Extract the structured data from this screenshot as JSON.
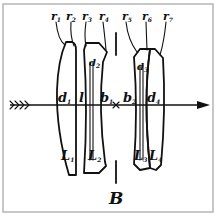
{
  "figure": {
    "frame_color": "#b5b5b5",
    "ink_color": "#111111",
    "background": "#ffffff"
  },
  "radii_labels": [
    {
      "id": "r1",
      "base": "r",
      "sub": "1"
    },
    {
      "id": "r2",
      "base": "r",
      "sub": "2"
    },
    {
      "id": "r3",
      "base": "r",
      "sub": "3"
    },
    {
      "id": "r4",
      "base": "r",
      "sub": "4"
    },
    {
      "id": "r5",
      "base": "r",
      "sub": "5"
    },
    {
      "id": "r6",
      "base": "r",
      "sub": "6"
    },
    {
      "id": "r7",
      "base": "r",
      "sub": "7"
    }
  ],
  "thickness_labels": [
    {
      "id": "d1",
      "base": "d",
      "sub": "1"
    },
    {
      "id": "d2",
      "base": "d",
      "sub": "2"
    },
    {
      "id": "d3",
      "base": "d",
      "sub": "3"
    },
    {
      "id": "d4",
      "base": "d",
      "sub": "4"
    }
  ],
  "spacing_labels": [
    {
      "id": "l",
      "base": "l",
      "sub": ""
    },
    {
      "id": "b1",
      "base": "b",
      "sub": "1"
    },
    {
      "id": "b2",
      "base": "b",
      "sub": "2"
    }
  ],
  "lens_labels": [
    {
      "id": "L1",
      "base": "L",
      "sub": "1"
    },
    {
      "id": "L2",
      "base": "L",
      "sub": "2"
    },
    {
      "id": "L3",
      "base": "L",
      "sub": "3"
    },
    {
      "id": "L4",
      "base": "L",
      "sub": "4"
    }
  ],
  "stop": {
    "label": "B"
  },
  "optical_axis": {
    "direction": "left-to-right",
    "tail": "feathered-arrow-icon",
    "head": "arrowhead-icon"
  }
}
